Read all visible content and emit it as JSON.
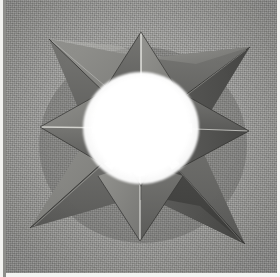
{
  "image": {
    "kind": "photograph",
    "subject": "modular origami eight-pointed star",
    "color_mode": "grayscale",
    "width_px": 280,
    "height_px": 277,
    "alt": "Black and white photograph of a folded paper eight-pointed modular origami star resting on a textured gray fabric surface, with a brightly overexposed white octagonal opening at its center.",
    "background": {
      "name": "textured gray fabric backdrop",
      "color": "#9b9b98",
      "texture": "fine woven cloth weave"
    },
    "borders": {
      "left_paper_margin_color": "#f2f2f0",
      "left_rule_color": "#8d8d8a",
      "right_paper_margin_color": "#f4f4f2",
      "bottom_paper_margin_color": "#f3f3f1"
    }
  },
  "subject": {
    "name": "origami star",
    "center": {
      "x": 141,
      "y": 128
    },
    "center_opening": {
      "name": "white center opening",
      "shape": "octagon",
      "color": "#ffffff",
      "radius_px": 52
    },
    "point_count": 8,
    "long_point_count": 4,
    "short_point_count": 4,
    "points": [
      {
        "label": "north point",
        "angle_deg": 270,
        "length": "short",
        "tip_x": 141,
        "tip_y": 32
      },
      {
        "label": "northeast point",
        "angle_deg": 315,
        "length": "long",
        "tip_x": 250,
        "tip_y": 47
      },
      {
        "label": "east point",
        "angle_deg": 0,
        "length": "short",
        "tip_x": 249,
        "tip_y": 131
      },
      {
        "label": "southeast point",
        "angle_deg": 45,
        "length": "long",
        "tip_x": 245,
        "tip_y": 244
      },
      {
        "label": "south point",
        "angle_deg": 90,
        "length": "short",
        "tip_x": 140,
        "tip_y": 241
      },
      {
        "label": "southwest point",
        "angle_deg": 135,
        "length": "long",
        "tip_x": 30,
        "tip_y": 228
      },
      {
        "label": "west point",
        "angle_deg": 180,
        "length": "short",
        "tip_x": 40,
        "tip_y": 127
      },
      {
        "label": "northwest point",
        "angle_deg": 225,
        "length": "long",
        "tip_x": 49,
        "tip_y": 39
      }
    ],
    "paper_tones": {
      "highlight": "#c8c8c4",
      "light": "#a9a9a5",
      "mid": "#8a8a86",
      "shade": "#6f6f6c",
      "dark": "#585856",
      "deep_shadow": "#474745",
      "crease_white": "#f0f0ec"
    }
  }
}
